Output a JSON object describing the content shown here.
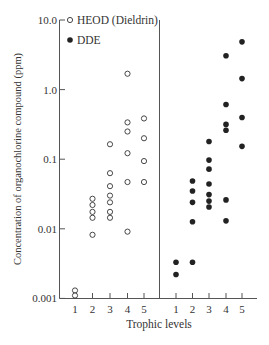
{
  "chart_data": {
    "type": "scatter",
    "title": "",
    "xlabel": "Trophic levels",
    "ylabel": "Concentration of organochlorine compound (ppm)",
    "yscale": "log",
    "ylim": [
      0.001,
      10.0
    ],
    "yticks": [
      "10.0",
      "1.0",
      "0.1",
      "0.01",
      "0.001"
    ],
    "xticks_left": [
      "1",
      "2",
      "3",
      "4",
      "5"
    ],
    "xticks_right": [
      "1",
      "2",
      "3",
      "4",
      "5"
    ],
    "grid": false,
    "legend": {
      "position": "upper-left",
      "entries": [
        {
          "label": "HEOD (Dieldrin)",
          "marker": "open-circle"
        },
        {
          "label": "DDE",
          "marker": "filled-circle"
        }
      ]
    },
    "series": [
      {
        "name": "HEOD (Dieldrin)",
        "panel": "left",
        "marker": "open-circle",
        "points": [
          {
            "x": 1,
            "y": 0.0013
          },
          {
            "x": 1,
            "y": 0.0011
          },
          {
            "x": 2,
            "y": 0.027
          },
          {
            "x": 2,
            "y": 0.022
          },
          {
            "x": 2,
            "y": 0.0175
          },
          {
            "x": 2,
            "y": 0.0144
          },
          {
            "x": 2,
            "y": 0.0082
          },
          {
            "x": 3,
            "y": 0.164
          },
          {
            "x": 3,
            "y": 0.063
          },
          {
            "x": 3,
            "y": 0.041
          },
          {
            "x": 3,
            "y": 0.03
          },
          {
            "x": 3,
            "y": 0.024
          },
          {
            "x": 3,
            "y": 0.0175
          },
          {
            "x": 3,
            "y": 0.0144
          },
          {
            "x": 4,
            "y": 1.69
          },
          {
            "x": 4,
            "y": 0.338
          },
          {
            "x": 4,
            "y": 0.25
          },
          {
            "x": 4,
            "y": 0.122
          },
          {
            "x": 4,
            "y": 0.047
          },
          {
            "x": 4,
            "y": 0.0091
          },
          {
            "x": 5,
            "y": 0.385
          },
          {
            "x": 5,
            "y": 0.2
          },
          {
            "x": 5,
            "y": 0.094
          },
          {
            "x": 5,
            "y": 0.047
          }
        ]
      },
      {
        "name": "DDE",
        "panel": "right",
        "marker": "filled-circle",
        "points": [
          {
            "x": 1,
            "y": 0.0033
          },
          {
            "x": 1,
            "y": 0.0022
          },
          {
            "x": 2,
            "y": 0.0485
          },
          {
            "x": 2,
            "y": 0.035
          },
          {
            "x": 2,
            "y": 0.024
          },
          {
            "x": 2,
            "y": 0.0126
          },
          {
            "x": 2,
            "y": 0.0033
          },
          {
            "x": 3,
            "y": 0.18
          },
          {
            "x": 3,
            "y": 0.097
          },
          {
            "x": 3,
            "y": 0.072
          },
          {
            "x": 3,
            "y": 0.044
          },
          {
            "x": 3,
            "y": 0.031
          },
          {
            "x": 3,
            "y": 0.025
          },
          {
            "x": 3,
            "y": 0.0206
          },
          {
            "x": 4,
            "y": 3.06
          },
          {
            "x": 4,
            "y": 0.61
          },
          {
            "x": 4,
            "y": 0.316
          },
          {
            "x": 4,
            "y": 0.26
          },
          {
            "x": 4,
            "y": 0.026
          },
          {
            "x": 4,
            "y": 0.013
          },
          {
            "x": 5,
            "y": 4.85
          },
          {
            "x": 5,
            "y": 1.44
          },
          {
            "x": 5,
            "y": 0.398
          },
          {
            "x": 5,
            "y": 0.153
          }
        ]
      }
    ]
  },
  "colors": {
    "axis": "#555555",
    "marker": "#222222",
    "text": "#333333",
    "background": "#ffffff"
  }
}
